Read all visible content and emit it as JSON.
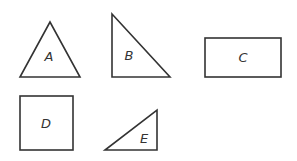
{
  "diagram": {
    "shapes": [
      {
        "id": "A",
        "label": "A",
        "type": "triangle-isosceles"
      },
      {
        "id": "B",
        "label": "B",
        "type": "triangle-right"
      },
      {
        "id": "C",
        "label": "C",
        "type": "rectangle"
      },
      {
        "id": "D",
        "label": "D",
        "type": "square"
      },
      {
        "id": "E",
        "label": "E",
        "type": "triangle-right"
      }
    ],
    "stroke_color": "#333333",
    "background": "#ffffff"
  }
}
